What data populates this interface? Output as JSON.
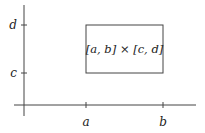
{
  "diagram": {
    "box_label": "[a, b] × [c, d]",
    "x_ticks": [
      {
        "label": "a",
        "x": 86
      },
      {
        "label": "b",
        "x": 163
      }
    ],
    "y_ticks": [
      {
        "label": "c",
        "y": 73
      },
      {
        "label": "d",
        "y": 25
      }
    ],
    "axes": {
      "x_axis": {
        "y": 105,
        "x_start": 14,
        "x_end": 196
      },
      "y_axis": {
        "x": 24,
        "y_start": 5,
        "y_end": 116
      }
    },
    "rectangle": {
      "x": 86,
      "y": 25,
      "width": 77,
      "height": 48
    },
    "colors": {
      "stroke": "#444444",
      "text": "#222222",
      "background": "#ffffff"
    }
  }
}
